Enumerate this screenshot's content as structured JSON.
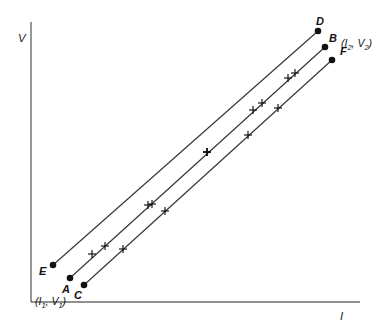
{
  "figure": {
    "background_color": "#ffffff",
    "line_color": "#3a3a3a",
    "marker_color": "#111111"
  },
  "axes": {
    "y_label": "V",
    "x_label": "I",
    "origin": {
      "x": 31,
      "y": 302
    },
    "y_top": 22,
    "x_right": 360,
    "axis_color": "#6b6b6b"
  },
  "chart_data": {
    "type": "line",
    "title": "",
    "xlabel": "I",
    "ylabel": "V",
    "grid": false,
    "legend_position": "none",
    "annotations": [
      {
        "text": "(I1, V1)",
        "x": 35,
        "y": 296,
        "note": "lower-left common coordinate"
      },
      {
        "text": "(I2, V2)",
        "x": 341,
        "y": 38,
        "note": "upper-right coordinate near B"
      }
    ],
    "series": [
      {
        "name": "E-D",
        "start_label": "E",
        "end_label": "D",
        "start_point": {
          "x": 53,
          "y": 265
        },
        "end_point": {
          "x": 318,
          "y": 31
        },
        "markers": [
          {
            "x": 92,
            "y": 254
          },
          {
            "x": 148,
            "y": 205
          },
          {
            "x": 207,
            "y": 152
          },
          {
            "x": 253,
            "y": 110
          },
          {
            "x": 288,
            "y": 78
          }
        ]
      },
      {
        "name": "A-B",
        "start_label": "A",
        "end_label": "B",
        "start_point": {
          "x": 70,
          "y": 278
        },
        "end_point": {
          "x": 325,
          "y": 47
        },
        "markers": [
          {
            "x": 105,
            "y": 246
          },
          {
            "x": 152,
            "y": 204
          },
          {
            "x": 207,
            "y": 152
          },
          {
            "x": 262,
            "y": 103
          },
          {
            "x": 295,
            "y": 73
          }
        ]
      },
      {
        "name": "C-F",
        "start_label": "C",
        "end_label": "F",
        "start_point": {
          "x": 84,
          "y": 285
        },
        "end_point": {
          "x": 332,
          "y": 60
        },
        "markers": [
          {
            "x": 123,
            "y": 249
          },
          {
            "x": 165,
            "y": 211
          },
          {
            "x": 207,
            "y": 152
          },
          {
            "x": 248,
            "y": 135
          },
          {
            "x": 278,
            "y": 108
          }
        ]
      }
    ],
    "points": [
      {
        "label": "A",
        "x": 70,
        "y": 278,
        "label_x": 62,
        "label_y": 284
      },
      {
        "label": "B",
        "x": 325,
        "y": 47,
        "label_x": 329,
        "label_y": 33
      },
      {
        "label": "C",
        "x": 84,
        "y": 285,
        "label_x": 74,
        "label_y": 290
      },
      {
        "label": "D",
        "x": 318,
        "y": 31,
        "label_x": 316,
        "label_y": 16
      },
      {
        "label": "E",
        "x": 53,
        "y": 265,
        "label_x": 39,
        "label_y": 266
      },
      {
        "label": "F",
        "x": 332,
        "y": 60,
        "label_x": 340,
        "label_y": 46
      }
    ]
  }
}
